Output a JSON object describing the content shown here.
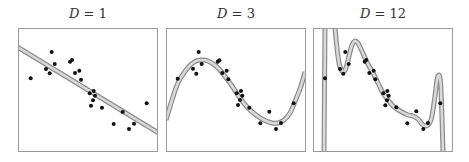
{
  "chart_data": [
    {
      "type": "line",
      "title": "D = 1",
      "title_var": "D",
      "title_val": "1",
      "xlabel": "",
      "ylabel": "",
      "grid": false,
      "legend": "none",
      "description": "Degree-1 polynomial fit (straight line) to scattered data points",
      "fit_curve": [
        [
          0,
          19.3
        ],
        [
          140,
          104.7
        ]
      ],
      "points": [
        [
          12.7,
          50.3
        ],
        [
          33.7,
          24
        ],
        [
          28,
          41
        ],
        [
          31.7,
          45.3
        ],
        [
          36.7,
          36
        ],
        [
          52,
          33.7
        ],
        [
          54,
          32
        ],
        [
          57,
          45
        ],
        [
          61.3,
          42.7
        ],
        [
          63,
          51.7
        ],
        [
          71.7,
          65.3
        ],
        [
          75.7,
          63
        ],
        [
          77,
          67.7
        ],
        [
          75,
          72.3
        ],
        [
          73,
          77.7
        ],
        [
          84,
          79.7
        ],
        [
          104.7,
          84
        ],
        [
          95.7,
          96
        ],
        [
          116,
          95.7
        ],
        [
          111,
          101
        ],
        [
          128.7,
          75.3
        ]
      ]
    },
    {
      "type": "line",
      "title": "D = 3",
      "title_var": "D",
      "title_val": "3",
      "xlabel": "",
      "ylabel": "",
      "grid": false,
      "legend": "none",
      "description": "Degree-3 polynomial fit to same data points",
      "fit_curve": [
        [
          0,
          92
        ],
        [
          6,
          72
        ],
        [
          12,
          55
        ],
        [
          20,
          42
        ],
        [
          28,
          34
        ],
        [
          35,
          32
        ],
        [
          42,
          33
        ],
        [
          50,
          38
        ],
        [
          58,
          47
        ],
        [
          66,
          58
        ],
        [
          74,
          70
        ],
        [
          82,
          80
        ],
        [
          90,
          87
        ],
        [
          98,
          92
        ],
        [
          106,
          95
        ],
        [
          112,
          95
        ],
        [
          118,
          92
        ],
        [
          124,
          85
        ],
        [
          130,
          71
        ],
        [
          135,
          58
        ],
        [
          139,
          44
        ]
      ],
      "points": [
        [
          11.7,
          50.7
        ],
        [
          32.7,
          24
        ],
        [
          27,
          40.7
        ],
        [
          30.3,
          45.7
        ],
        [
          35.7,
          36
        ],
        [
          51.7,
          33.7
        ],
        [
          53.3,
          32.3
        ],
        [
          56.3,
          45
        ],
        [
          60.7,
          42.7
        ],
        [
          62.3,
          51.3
        ],
        [
          70.7,
          65.3
        ],
        [
          75,
          63
        ],
        [
          76.3,
          67.7
        ],
        [
          74,
          72
        ],
        [
          72,
          77
        ],
        [
          83.3,
          79.7
        ],
        [
          103.3,
          83.7
        ],
        [
          94.3,
          95.3
        ],
        [
          115,
          95
        ],
        [
          110,
          101
        ],
        [
          127.7,
          75.3
        ]
      ]
    },
    {
      "type": "line",
      "title": "D = 12",
      "title_var": "D",
      "title_val": "12",
      "xlabel": "",
      "ylabel": "",
      "grid": false,
      "legend": "none",
      "description": "Degree-12 polynomial fit showing overfitting with wild oscillations",
      "fit_curve_segments": [
        [
          [
            11,
            124
          ],
          [
            11.5,
            60
          ],
          [
            12,
            0
          ]
        ],
        [
          [
            22,
            0
          ],
          [
            24,
            20
          ],
          [
            26,
            35
          ],
          [
            28,
            41
          ],
          [
            30,
            44
          ],
          [
            33,
            40
          ],
          [
            36,
            28
          ],
          [
            39,
            17
          ],
          [
            42,
            13
          ],
          [
            45,
            15
          ],
          [
            48,
            21
          ],
          [
            52,
            30
          ],
          [
            56,
            38
          ],
          [
            60,
            45
          ],
          [
            65,
            55
          ],
          [
            70,
            65
          ],
          [
            75,
            72
          ],
          [
            80,
            78
          ],
          [
            87,
            83
          ],
          [
            95,
            87
          ],
          [
            100,
            88
          ],
          [
            105,
            91
          ],
          [
            109,
            96
          ],
          [
            112,
            98
          ],
          [
            115,
            97
          ],
          [
            118,
            92
          ],
          [
            120,
            82
          ],
          [
            122,
            68
          ],
          [
            124,
            52
          ],
          [
            125.5,
            47
          ],
          [
            127,
            50
          ],
          [
            128,
            62
          ],
          [
            129,
            90
          ],
          [
            130,
            124
          ]
        ]
      ],
      "points": [
        [
          12,
          50.3
        ],
        [
          32.3,
          24
        ],
        [
          27,
          41
        ],
        [
          30.3,
          45.7
        ],
        [
          35.7,
          36
        ],
        [
          51.7,
          33.7
        ],
        [
          53.3,
          32
        ],
        [
          56.3,
          45
        ],
        [
          60.7,
          42.7
        ],
        [
          62.3,
          51.3
        ],
        [
          70.3,
          65.3
        ],
        [
          74.3,
          63
        ],
        [
          75.7,
          67.7
        ],
        [
          74,
          72.3
        ],
        [
          72.3,
          77.3
        ],
        [
          83.3,
          79.3
        ],
        [
          103.3,
          83.3
        ],
        [
          94.3,
          95.3
        ],
        [
          115,
          95
        ],
        [
          110.3,
          101
        ],
        [
          127.3,
          75.3
        ]
      ]
    }
  ],
  "colors": {
    "frame": "#9a9a9a",
    "curve_edge": "#8a8a8a",
    "curve_fill": "#d8d8d8",
    "point": "#111111",
    "title": "#333333"
  },
  "panels": [
    {
      "title_var": "D",
      "title_eq": " = ",
      "title_val": "1"
    },
    {
      "title_var": "D",
      "title_eq": " = ",
      "title_val": "3"
    },
    {
      "title_var": "D",
      "title_eq": " = ",
      "title_val": "12"
    }
  ]
}
